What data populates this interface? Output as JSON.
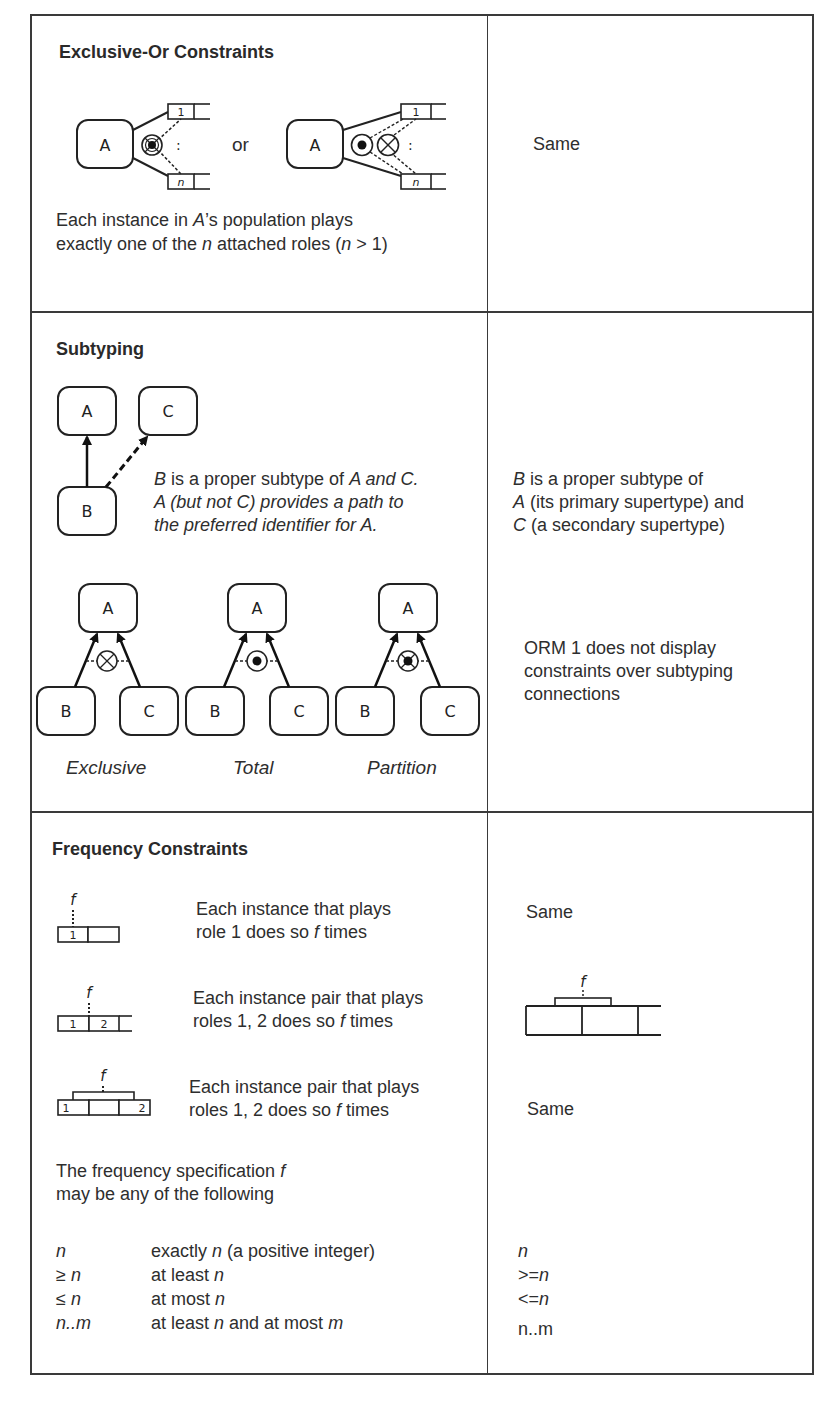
{
  "page_header_fragment": "ORM 1",
  "rows": [
    {
      "id": "exclusive-or",
      "left": {
        "heading": "Exclusive-Or Constraints",
        "diagram_a": {
          "object_label": "A",
          "role_top": "1",
          "role_bottom": "n",
          "ellipsis": ":"
        },
        "connector": "or",
        "diagram_b": {
          "object_label": "A",
          "role_top": "1",
          "role_bottom": "n",
          "ellipsis": ":"
        },
        "desc_line1_pre": "Each instance in ",
        "desc_line1_var": "A",
        "desc_line1_post": "’s population plays",
        "desc_line2_pre": "exactly one of the ",
        "desc_line2_var": "n",
        "desc_line2_mid": " attached roles (",
        "desc_line2_var2": "n",
        "desc_line2_post": " > 1)"
      },
      "right": {
        "text": "Same"
      }
    },
    {
      "id": "subtyping",
      "left": {
        "heading": "Subtyping",
        "diagram": {
          "a": "A",
          "b": "B",
          "c": "C"
        },
        "desc_lines": [
          {
            "parts": [
              {
                "t": "B",
                "i": true
              },
              {
                "t": " is a proper subtype of ",
                "i": false
              },
              {
                "t": "A and C.",
                "i": true
              }
            ]
          },
          {
            "parts": [
              {
                "t": "A (but not C) provides a path to",
                "i": true
              }
            ]
          },
          {
            "parts": [
              {
                "t": "the preferred identifier for A.",
                "i": true
              }
            ]
          }
        ],
        "constraint_diagrams": [
          {
            "caption": "Exclusive",
            "top": "A",
            "left": "B",
            "right": "C",
            "symbol": "exclusion"
          },
          {
            "caption": "Total",
            "top": "A",
            "left": "B",
            "right": "C",
            "symbol": "inclusive-or"
          },
          {
            "caption": "Partition",
            "top": "A",
            "left": "B",
            "right": "C",
            "symbol": "exclusive-or"
          }
        ]
      },
      "right": {
        "subtype_desc": [
          {
            "var": "B",
            "text": " is a proper subtype of"
          },
          {
            "var": "A",
            "text": " (its primary supertype) and"
          },
          {
            "var": "C",
            "text": " (a secondary supertype)"
          }
        ],
        "note_lines": [
          "ORM 1 does not display",
          "constraints over subtyping",
          "connections"
        ]
      }
    },
    {
      "id": "frequency",
      "left": {
        "heading": "Frequency Constraints",
        "examples": [
          {
            "f_label": "f",
            "roles": [
              "1",
              ""
            ],
            "line1": "Each instance that plays",
            "line2_pre": "role 1 does so ",
            "line2_var": "f",
            "line2_post": " times"
          },
          {
            "f_label": "f",
            "roles": [
              "1",
              "2",
              ""
            ],
            "line1": "Each instance pair that plays",
            "line2_pre": "roles 1, 2 does so ",
            "line2_var": "f",
            "line2_post": " times"
          },
          {
            "f_label": "f",
            "roles": [
              "1",
              "",
              "2"
            ],
            "line1": "Each instance pair that plays",
            "line2_pre": "roles 1, 2 does so ",
            "line2_var": "f",
            "line2_post": " times"
          }
        ],
        "spec_intro_line1_pre": "The frequency specification ",
        "spec_intro_line1_var": "f",
        "spec_intro_line2": "may be any of the following",
        "spec_rows": [
          {
            "symbol": "n",
            "desc_pre": "exactly ",
            "desc_var": "n",
            "desc_post": " (a positive integer)",
            "desc_var2": "",
            "desc_post2": ""
          },
          {
            "symbol": "≥ n",
            "desc_pre": "at least ",
            "desc_var": "n",
            "desc_post": "",
            "desc_var2": "",
            "desc_post2": ""
          },
          {
            "symbol": "≤ n",
            "desc_pre": "at most ",
            "desc_var": "n",
            "desc_post": "",
            "desc_var2": "",
            "desc_post2": ""
          },
          {
            "symbol": "n..m",
            "desc_pre": "at least ",
            "desc_var": "n",
            "desc_post": " and at most ",
            "desc_var2": "m",
            "desc_post2": ""
          }
        ]
      },
      "right": {
        "same_1": "Same",
        "diagram_f_label": "f",
        "same_3": "Same",
        "spec_symbols": [
          {
            "pre": "",
            "var": "n"
          },
          {
            "pre": ">=",
            "var": "n"
          },
          {
            "pre": "<=",
            "var": "n"
          },
          {
            "pre": "n..m",
            "var": ""
          }
        ]
      }
    }
  ]
}
